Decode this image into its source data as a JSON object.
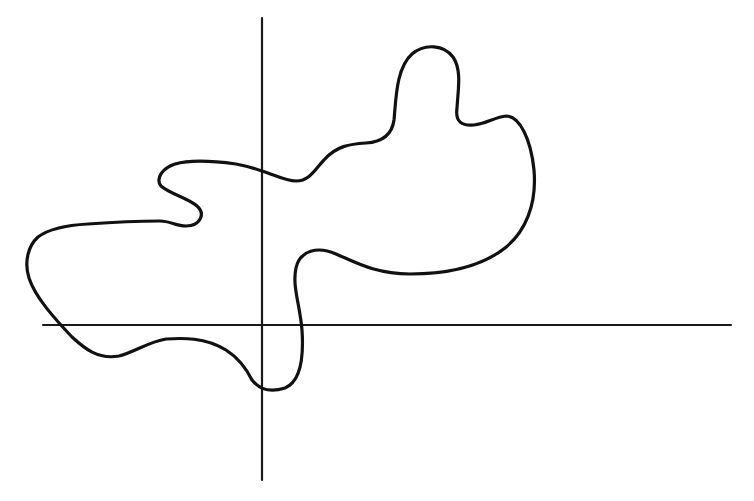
{
  "diagram": {
    "type": "closed-curve-on-axes",
    "background_color": "#ffffff",
    "stroke_color": "#111111",
    "axes": {
      "x_axis": {
        "y": 325,
        "x_start": 43,
        "x_end": 731
      },
      "y_axis": {
        "x": 262,
        "y_start": 18,
        "y_end": 480
      }
    },
    "curve": {
      "closed": true,
      "description": "Irregular closed blob shape crossing both axes, with a rounded bump at the top right and a small hook on the left",
      "path": "M262,171 C275,175 285,181 296,181 C310,181 316,168 324,160 C336,146 350,144 366,143 C382,142 392,135 394,120 C396,100 396,68 412,54 C425,43 444,45 453,57 C462,70 458,90 457,108 C455,122 462,126 474,125 C486,124 495,117 506,116 C520,116 531,140 534,170 C537,205 525,232 505,248 C482,266 450,274 410,274 C375,274 355,262 336,254 C318,246 300,250 296,268 C292,286 300,305 302,330 C304,360 300,382 285,388 C270,393 260,390 252,380 C245,366 237,357 226,350 C205,337 182,338 166,339 C148,342 135,352 119,356 C98,360 84,348 72,337 C55,319 35,297 29,278 C24,262 28,246 38,237 C50,228 70,225 88,224 C115,222 140,221 160,221 C170,221 176,226 186,226 C200,226 206,214 197,206 C188,198 170,194 161,186 C155,178 163,168 175,164 C192,159 214,161 236,164 C246,166 254,168 262,171 Z",
      "axis_crossings": [
        {
          "axis": "y",
          "point": [
            262,
            171
          ]
        },
        {
          "axis": "x",
          "point": [
            300,
            325
          ]
        },
        {
          "axis": "y",
          "point": [
            262,
            386
          ]
        },
        {
          "axis": "x",
          "point": [
            60,
            325
          ]
        }
      ]
    },
    "labels": []
  }
}
